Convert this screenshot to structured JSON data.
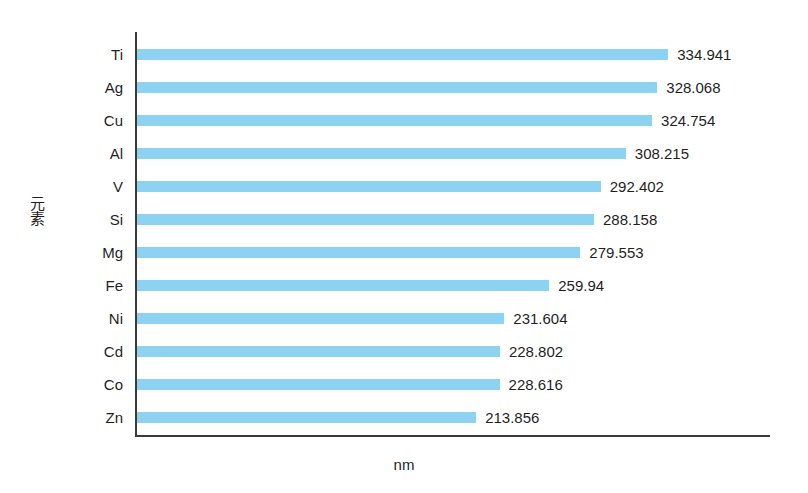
{
  "chart_data": {
    "type": "bar",
    "orientation": "horizontal",
    "title": "",
    "xlabel": "nm",
    "ylabel": "元素",
    "grid": false,
    "legend": false,
    "xlim": [
      0,
      400
    ],
    "categories": [
      "Ti",
      "Ag",
      "Cu",
      "Al",
      "V",
      "Si",
      "Mg",
      "Fe",
      "Ni",
      "Cd",
      "Co",
      "Zn"
    ],
    "values": [
      334.941,
      328.068,
      324.754,
      308.215,
      292.402,
      288.158,
      279.553,
      259.94,
      231.604,
      228.802,
      228.616,
      213.856
    ],
    "value_labels": [
      "334.941",
      "328.068",
      "324.754",
      "308.215",
      "292.402",
      "288.158",
      "279.553",
      "259.94",
      "231.604",
      "228.802",
      "228.616",
      "213.856"
    ],
    "bar_color": "#8ed2f2",
    "axis_color": "#3a3a3a",
    "background": "#ffffff"
  }
}
